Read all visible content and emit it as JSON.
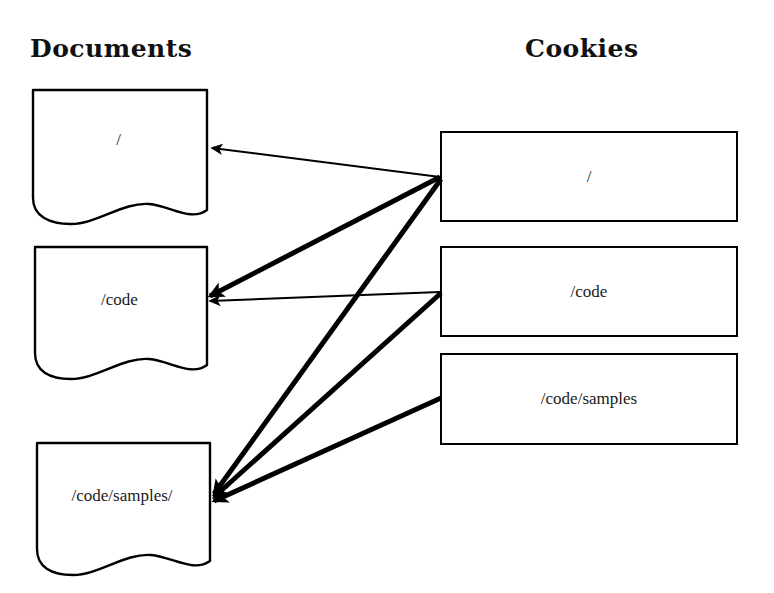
{
  "diagram": {
    "background_color": "#ffffff",
    "stroke_color": "#000000",
    "columns": {
      "documents_heading": "Documents",
      "cookies_heading": "Cookies"
    },
    "documents": [
      {
        "id": "doc-root",
        "label": "/",
        "x": 31,
        "y": 88,
        "w": 175,
        "h": 133
      },
      {
        "id": "doc-code",
        "label": "/code",
        "x": 33,
        "y": 245,
        "w": 173,
        "h": 131
      },
      {
        "id": "doc-code-samples",
        "label": "/code/samples/",
        "x": 35,
        "y": 441,
        "w": 174,
        "h": 130
      }
    ],
    "cookies": [
      {
        "id": "cookie-root",
        "label": "/",
        "x": 440,
        "y": 131,
        "w": 298,
        "h": 91
      },
      {
        "id": "cookie-code",
        "label": "/code",
        "x": 440,
        "y": 246,
        "w": 298,
        "h": 91
      },
      {
        "id": "cookie-code-samples",
        "label": "/code/samples",
        "x": 440,
        "y": 353,
        "w": 298,
        "h": 92
      }
    ],
    "arrows": [
      {
        "id": "arrow-root-to-root",
        "from": "cookie-root",
        "to": "doc-root",
        "x1": 440,
        "y1": 177,
        "x2": 212,
        "y2": 148,
        "width": 2
      },
      {
        "id": "arrow-root-to-code",
        "from": "cookie-root",
        "to": "doc-code",
        "x1": 440,
        "y1": 177,
        "x2": 210,
        "y2": 296,
        "width": 5
      },
      {
        "id": "arrow-root-to-code-samples",
        "from": "cookie-root",
        "to": "doc-code-samples",
        "x1": 441,
        "y1": 179,
        "x2": 214,
        "y2": 494,
        "width": 5
      },
      {
        "id": "arrow-code-to-code",
        "from": "cookie-code",
        "to": "doc-code",
        "x1": 440,
        "y1": 292,
        "x2": 210,
        "y2": 301,
        "width": 2
      },
      {
        "id": "arrow-code-to-code-samples",
        "from": "cookie-code",
        "to": "doc-code-samples",
        "x1": 441,
        "y1": 293,
        "x2": 214,
        "y2": 497,
        "width": 5
      },
      {
        "id": "arrow-code-samples-to-code-samples",
        "from": "cookie-code-samples",
        "to": "doc-code-samples",
        "x1": 441,
        "y1": 398,
        "x2": 214,
        "y2": 501,
        "width": 5
      }
    ]
  }
}
